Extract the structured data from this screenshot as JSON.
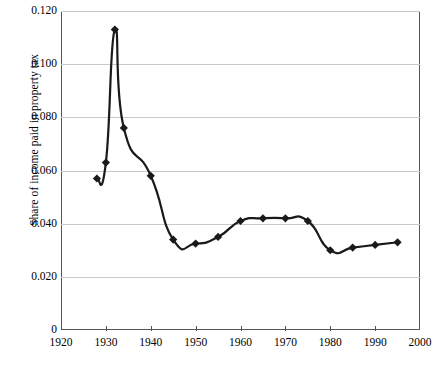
{
  "chart_data": {
    "type": "line",
    "title": "",
    "xlabel": "",
    "ylabel": "Share of income paid in property tax",
    "xlim": [
      1920,
      2000
    ],
    "ylim": [
      0,
      0.12
    ],
    "grid": true,
    "legend": "none",
    "marker": "diamond",
    "line_color": "#1a1a1a",
    "grid_color": "#c9c9c9",
    "axis_color": "#555555",
    "xticks": [
      1920,
      1930,
      1940,
      1950,
      1960,
      1970,
      1980,
      1990,
      2000
    ],
    "xtick_labels": [
      "1920",
      "1930",
      "1940",
      "1950",
      "1960",
      "1970",
      "1980",
      "1990",
      "2000"
    ],
    "yticks": [
      0,
      0.02,
      0.04,
      0.06,
      0.08,
      0.1,
      0.12
    ],
    "ytick_labels": [
      "0",
      "0.020",
      "0.040",
      "0.060",
      "0.080",
      "0.100",
      "0.120"
    ],
    "series": [
      {
        "name": "Share of income paid in property tax",
        "x": [
          1928,
          1930,
          1932,
          1934,
          1940,
          1945,
          1950,
          1955,
          1960,
          1965,
          1970,
          1975,
          1980,
          1985,
          1990,
          1995
        ],
        "values": [
          0.057,
          0.063,
          0.113,
          0.076,
          0.058,
          0.034,
          0.0325,
          0.035,
          0.041,
          0.042,
          0.042,
          0.041,
          0.03,
          0.031,
          0.032,
          0.033
        ]
      }
    ]
  }
}
